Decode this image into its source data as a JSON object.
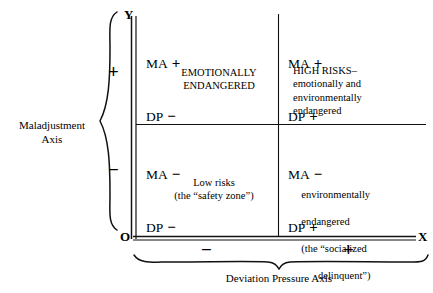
{
  "diagram": {
    "axes": {
      "y_letter": "Y",
      "origin_letter": "O",
      "x_letter": "X",
      "vertical_axis_name": "Maladjustment\nAxis",
      "horizontal_axis_name": "Deviation Pressure Axis",
      "vertical_positive_sign": "+",
      "vertical_negative_sign": "−",
      "horizontal_negative_sign": "−",
      "horizontal_positive_sign": "+"
    },
    "quadrants": {
      "upper_left": {
        "ma_label": "MA",
        "ma_sign": "+",
        "dp_label": "DP",
        "dp_sign": "−",
        "description": "EMOTIONALLY\nENDANGERED"
      },
      "upper_right": {
        "ma_label": "MA",
        "ma_sign": "+",
        "dp_label": "DP",
        "dp_sign": "+",
        "description": "HIGH RISKS–\nemotionally and\nenvironmentally\nendangered"
      },
      "lower_left": {
        "ma_label": "MA",
        "ma_sign": "−",
        "dp_label": "DP",
        "dp_sign": "−",
        "description": "Low risks\n(the “safety zone”)"
      },
      "lower_right": {
        "ma_label": "MA",
        "ma_sign": "−",
        "dp_label": "DP",
        "dp_sign": "+",
        "description_line1": "environmentally",
        "description_line2": "endangered",
        "description_line3": "(the “socialized",
        "description_line4": "delinquent”)"
      }
    },
    "colors": {
      "ink": "#111111",
      "background": "#ffffff"
    }
  }
}
